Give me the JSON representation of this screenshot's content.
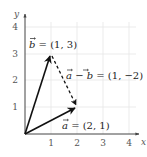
{
  "diagram": {
    "axes": {
      "x_label": "x",
      "y_label": "y",
      "x_ticks": [
        "1",
        "2",
        "3",
        "4"
      ],
      "y_ticks": [
        "1",
        "2",
        "3",
        "4"
      ]
    },
    "vectors": [
      {
        "name": "a",
        "label": "a = (2, 1)",
        "from": [
          0,
          0
        ],
        "to": [
          2,
          1
        ],
        "style": "solid"
      },
      {
        "name": "b",
        "label": "b = (1, 3)",
        "from": [
          0,
          0
        ],
        "to": [
          1,
          3
        ],
        "style": "solid"
      },
      {
        "name": "a-b",
        "label": "a - b = (1, -2)",
        "from": [
          1,
          3
        ],
        "to": [
          2,
          1
        ],
        "style": "dashed"
      }
    ],
    "labels": {
      "b": {
        "vec": "b",
        "rest": " = (1, 3)"
      },
      "a": {
        "vec": "a",
        "rest": " = (2, 1)"
      },
      "amb": {
        "vec1": "a",
        "mid": " − ",
        "vec2": "b",
        "rest": " = (1, −2)"
      }
    },
    "colors": {
      "axis": "#444444",
      "grid": "#e6e6e6",
      "vector": "#111111"
    }
  }
}
